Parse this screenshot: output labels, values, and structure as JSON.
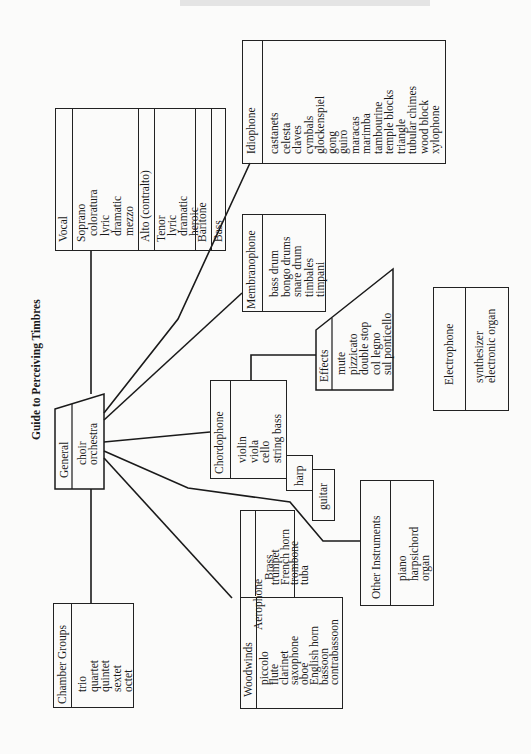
{
  "title": "Guide to Perceiving Timbres",
  "central": {
    "label": "General",
    "items": [
      "choir",
      "orchestra"
    ]
  },
  "vocal": {
    "label": "Vocal",
    "soprano": {
      "label": "Soprano",
      "items": [
        "coloratura",
        "lyric",
        "dramatic",
        "mezzo"
      ]
    },
    "alto": {
      "label": "Alto (contralto)"
    },
    "tenor": {
      "label": "Tenor",
      "items": [
        "lyric",
        "dramatic",
        "heroic"
      ]
    },
    "baritone": {
      "label": "Baritone"
    },
    "bass": {
      "label": "Bass"
    }
  },
  "idiophone": {
    "label": "Idiophone",
    "items": [
      "castanets",
      "celesta",
      "claves",
      "cymbals",
      "glockenspiel",
      "gong",
      "guiro",
      "maracas",
      "marimba",
      "tambourine",
      "temple blocks",
      "triangle",
      "tubular chimes",
      "wood block",
      "xylophone"
    ]
  },
  "membranophone": {
    "label": "Membranophone",
    "items": [
      "bass drum",
      "bongo drums",
      "snare drum",
      "timbales",
      "timpani"
    ]
  },
  "effects": {
    "label": "Effects",
    "items": [
      "mute",
      "pizzicato",
      "double stop",
      "col legno",
      "sul ponticello"
    ]
  },
  "chordophone": {
    "label": "Chordophone",
    "items": [
      "violin",
      "viola",
      "cello",
      "string bass"
    ],
    "harp": "harp",
    "guitar": "guitar"
  },
  "electrophone": {
    "label": "Electrophone",
    "items": [
      "synthesizer",
      "electronic organ"
    ]
  },
  "other": {
    "label": "Other Instruments",
    "items": [
      "piano",
      "harpsichord",
      "organ"
    ]
  },
  "aerophone": {
    "label": "Aerophone",
    "brass": {
      "label": "Brass",
      "items": [
        "trumpet",
        "French horn",
        "trombone",
        "tuba"
      ]
    },
    "woodwinds": {
      "label": "Woodwinds",
      "items": [
        "piccolo",
        "flute",
        "clarinet",
        "saxophone",
        "oboe",
        "English horn",
        "bassoon",
        "contrabassoon"
      ]
    }
  },
  "chamber": {
    "label": "Chamber Groups",
    "items": [
      "trio",
      "quartet",
      "quintet",
      "sextet",
      "octet"
    ]
  },
  "colors": {
    "ink": "#1a1a1a",
    "paper": "#fbfbfa"
  }
}
